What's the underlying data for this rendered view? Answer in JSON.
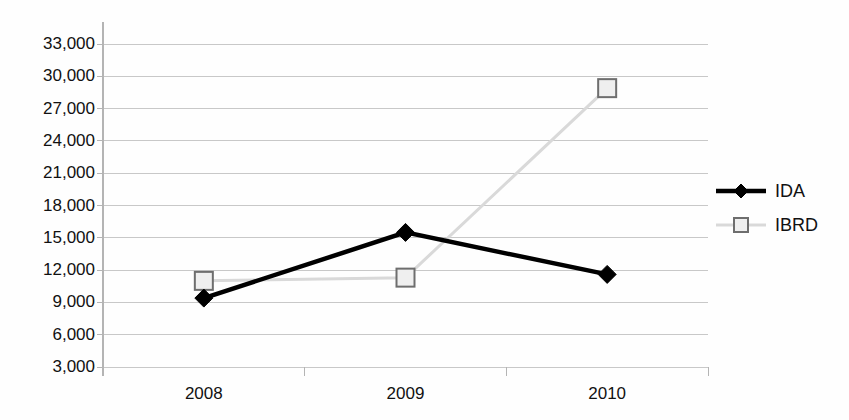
{
  "chart_data": {
    "type": "line",
    "title": "",
    "subtitle": "",
    "xlabel": "",
    "ylabel": "",
    "categories": [
      "2008",
      "2009",
      "2010"
    ],
    "series": [
      {
        "name": "IDA",
        "marker": "diamond",
        "color": "#000000",
        "line_color": "#000000",
        "values": [
          9400,
          15500,
          11600
        ]
      },
      {
        "name": "IBRD",
        "marker": "square",
        "color": "#d9d9d9",
        "line_color": "#d9d9d9",
        "values": [
          11000,
          11300,
          28900
        ]
      }
    ],
    "ylim": [
      3000,
      33000
    ],
    "yticks": [
      3000,
      6000,
      9000,
      12000,
      15000,
      18000,
      21000,
      24000,
      27000,
      30000,
      33000
    ],
    "ytick_labels": [
      "3,000",
      "6,000",
      "9,000",
      "12,000",
      "15,000",
      "18,000",
      "21,000",
      "24,000",
      "27,000",
      "30,000",
      "33,000"
    ],
    "xtick_labels": [
      "2008",
      "2009",
      "2010"
    ],
    "grid": true,
    "grid_axis": "y",
    "grid_color": "#c8c8c8",
    "axis_color": "#b4b4b4",
    "legend": {
      "position": "right",
      "entries": [
        {
          "label": "IDA",
          "marker": "diamond",
          "color": "#000000"
        },
        {
          "label": "IBRD",
          "marker": "square",
          "color": "#d9d9d9"
        }
      ]
    },
    "background": "#ffffff"
  },
  "legend": {
    "ida_label": "IDA",
    "ibrd_label": "IBRD"
  }
}
